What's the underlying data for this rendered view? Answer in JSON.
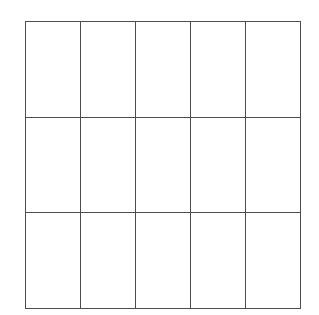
{
  "figure": {
    "name": "blank-grid",
    "type": "grid",
    "background_color": "#ffffff",
    "line_color": "#4d4d4d",
    "line_width_px": 1,
    "rows": 3,
    "columns": 5,
    "total_cells": 15,
    "bounds": {
      "left_px": 25,
      "top_px": 21,
      "right_px": 300,
      "bottom_px": 308,
      "width_px": 275,
      "height_px": 287
    },
    "cell_size": {
      "width_px": 55,
      "height_px": 95.7
    },
    "vertical_line_positions_px": [
      25,
      79,
      134,
      188,
      244,
      299
    ],
    "horizontal_line_positions_px": [
      21,
      118,
      215,
      308
    ]
  },
  "grid": {
    "cells": [
      [
        "",
        "",
        "",
        "",
        ""
      ],
      [
        "",
        "",
        "",
        "",
        ""
      ],
      [
        "",
        "",
        "",
        "",
        ""
      ]
    ]
  }
}
